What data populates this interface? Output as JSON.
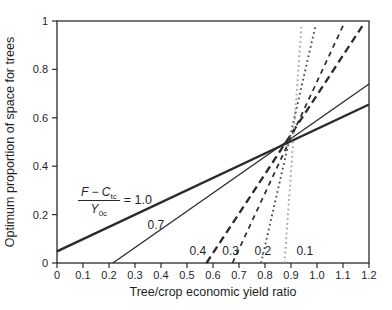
{
  "colors": {
    "ink": "#2a2a2a",
    "dotted_dark": "#4a4a4a",
    "dotted_light": "#a3a3a3",
    "background": "#ffffff"
  },
  "annotation": {
    "num_main": "F − C",
    "num_sub": "tc",
    "den_main": "Y",
    "den_sub": "0c",
    "equals": "= 1.0"
  },
  "chart_data": {
    "type": "line",
    "title": "",
    "xlabel": "Tree/crop economic yield ratio",
    "ylabel": "Optimum proportion of space for trees",
    "xlim": [
      0,
      1.2
    ],
    "ylim": [
      0,
      1
    ],
    "grid": false,
    "legend_position": "none",
    "x_ticks": [
      {
        "value": 0,
        "label": "0"
      },
      {
        "value": 0.1,
        "label": "0.1"
      },
      {
        "value": 0.2,
        "label": "0.2"
      },
      {
        "value": 0.3,
        "label": "0.3"
      },
      {
        "value": 0.4,
        "label": "0.4"
      },
      {
        "value": 0.5,
        "label": "0.5"
      },
      {
        "value": 0.6,
        "label": "0.6"
      },
      {
        "value": 0.7,
        "label": "0.7"
      },
      {
        "value": 0.8,
        "label": "0.8"
      },
      {
        "value": 0.9,
        "label": "0.9"
      },
      {
        "value": 1.0,
        "label": "1.0"
      },
      {
        "value": 1.1,
        "label": "1.1"
      },
      {
        "value": 1.2,
        "label": "1.2"
      }
    ],
    "y_ticks": [
      {
        "value": 0,
        "label": "0"
      },
      {
        "value": 0.2,
        "label": "0.2"
      },
      {
        "value": 0.4,
        "label": "0.4"
      },
      {
        "value": 0.6,
        "label": "0.6"
      },
      {
        "value": 0.8,
        "label": "0.8"
      },
      {
        "value": 1,
        "label": "1"
      }
    ],
    "series": [
      {
        "name": "(F−Ctc)/Y0c = 1.0",
        "label": "1.0",
        "style": "solid-thick",
        "points": [
          [
            0,
            0.048
          ],
          [
            1.2,
            0.655
          ]
        ]
      },
      {
        "name": "(F−Ctc)/Y0c = 0.7",
        "label": "0.7",
        "style": "solid",
        "points": [
          [
            0.215,
            0
          ],
          [
            1.2,
            0.74
          ]
        ]
      },
      {
        "name": "(F−Ctc)/Y0c = 0.4",
        "label": "0.4",
        "style": "dashed-thick",
        "points": [
          [
            0.575,
            0
          ],
          [
            1.175,
            0.98
          ]
        ]
      },
      {
        "name": "(F−Ctc)/Y0c = 0.3",
        "label": "0.3",
        "style": "dashed",
        "points": [
          [
            0.675,
            0
          ],
          [
            1.1,
            0.98
          ]
        ]
      },
      {
        "name": "(F−Ctc)/Y0c = 0.2",
        "label": "0.2",
        "style": "dotted",
        "points": [
          [
            0.785,
            0
          ],
          [
            0.993,
            0.975
          ]
        ]
      },
      {
        "name": "(F−Ctc)/Y0c = 0.1",
        "label": "0.1",
        "style": "dotted-light",
        "points": [
          [
            0.875,
            0
          ],
          [
            0.94,
            0.975
          ]
        ]
      }
    ],
    "line_labels": [
      {
        "text": "0.7",
        "x": 0.38,
        "y": 0.155
      },
      {
        "text": "0.4",
        "x": 0.542,
        "y": 0.048
      },
      {
        "text": "0.3",
        "x": 0.668,
        "y": 0.048
      },
      {
        "text": "0.2",
        "x": 0.792,
        "y": 0.048
      },
      {
        "text": "0.1",
        "x": 0.953,
        "y": 0.048
      }
    ]
  }
}
